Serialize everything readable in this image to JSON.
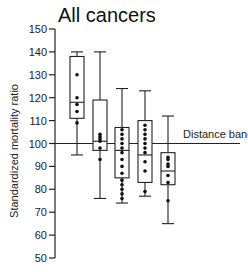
{
  "chart_data": {
    "type": "box",
    "title": "All cancers",
    "xlabel": "",
    "ylabel": "Standardized mortality ratio",
    "ylim": [
      50,
      150
    ],
    "yticks": [
      50,
      60,
      70,
      80,
      90,
      100,
      110,
      120,
      130,
      140,
      150
    ],
    "grid": false,
    "reference_line": {
      "y": 100,
      "label": "Distance bands"
    },
    "categories": [
      "Band 1",
      "Band 2",
      "Band 3",
      "Band 4",
      "Band 5"
    ],
    "boxes": [
      {
        "whisker_high": 140,
        "q3": 138,
        "median": 118,
        "q1": 111,
        "whisker_low": 95,
        "points": [
          130,
          120,
          117,
          114,
          109
        ]
      },
      {
        "whisker_high": 140,
        "q3": 119,
        "median": 101,
        "q1": 97,
        "whisker_low": 76,
        "points": [
          104,
          103,
          102,
          101,
          98,
          93
        ]
      },
      {
        "whisker_high": 124,
        "q3": 107,
        "median": 97,
        "q1": 85,
        "whisker_low": 74,
        "points": [
          106,
          104,
          102,
          100,
          98,
          96,
          93,
          90,
          87,
          84,
          82,
          80,
          78,
          76
        ]
      },
      {
        "whisker_high": 123,
        "q3": 110,
        "median": 95,
        "q1": 83,
        "whisker_low": 77,
        "points": [
          108,
          106,
          104,
          102,
          100,
          98,
          96,
          92,
          88,
          79
        ]
      },
      {
        "whisker_high": 112,
        "q3": 96,
        "median": 88,
        "q1": 82,
        "whisker_low": 65,
        "points": [
          94,
          93,
          91,
          90,
          86,
          83,
          75
        ]
      }
    ]
  }
}
